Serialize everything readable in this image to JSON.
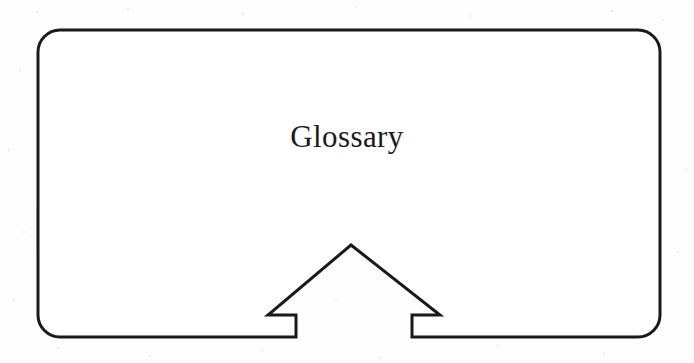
{
  "figure": {
    "type": "flowchart-node",
    "title": "Glossary",
    "shape_name": "rounded-rectangle-with-up-arrow-notch",
    "background_color": "#fdfdfd",
    "stroke_color": "#1a1a1a",
    "stroke_width": 3,
    "corner_radius": 22,
    "label": {
      "text": "Glossary",
      "font_size": 31,
      "center_x": 351,
      "baseline_y": 150,
      "color": "#1b1b1b"
    },
    "box": {
      "left": 38,
      "top": 30,
      "right": 660,
      "bottom": 337
    },
    "arrow_notch": {
      "description": "upward-pointing arrow cut into the bottom edge of the box",
      "apex_x": 351,
      "apex_y": 245,
      "left_barb_x": 268,
      "right_barb_x": 440,
      "barb_y": 315,
      "left_shaft_x": 296,
      "right_shaft_x": 412,
      "shaft_bottom_y": 337
    }
  },
  "icons": {
    "up_arrow": "arrow-up-icon"
  }
}
